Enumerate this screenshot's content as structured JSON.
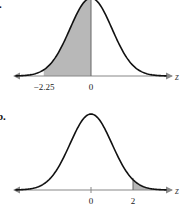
{
  "chart_data": [
    {
      "type": "area",
      "panel_label": "a.",
      "title": "",
      "xlabel": "z",
      "ylabel": "",
      "distribution": "standard normal",
      "tick_labels": [
        "-2.25",
        "0"
      ],
      "ticks": [
        -2.25,
        0
      ],
      "shaded_region": {
        "from": -2.25,
        "to": 0
      },
      "xlim": [
        -4,
        4
      ],
      "grid": false
    },
    {
      "type": "area",
      "panel_label": "b.",
      "title": "",
      "xlabel": "z",
      "ylabel": "",
      "distribution": "standard normal",
      "tick_labels": [
        "0",
        "2"
      ],
      "ticks": [
        0,
        2
      ],
      "shaded_region": {
        "from": 2,
        "to": "inf"
      },
      "xlim": [
        -4,
        4
      ],
      "grid": false
    }
  ],
  "panels": {
    "a": {
      "label": ".",
      "axis_var": "z",
      "ticks": [
        "−2.25",
        "0"
      ]
    },
    "b": {
      "label": "b.",
      "axis_var": "z",
      "ticks": [
        "0",
        "2"
      ]
    }
  },
  "colors": {
    "curve": "#111111",
    "shade": "#b8b8b8",
    "axis": "#888888"
  }
}
